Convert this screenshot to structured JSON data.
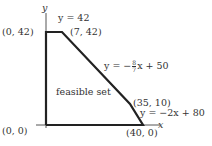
{
  "diagram": {
    "axes": {
      "x_label": "x",
      "y_label": "y"
    },
    "vertices": [
      {
        "label": "(0, 0)",
        "x": 0,
        "y": 0
      },
      {
        "label": "(0, 42)",
        "x": 0,
        "y": 42
      },
      {
        "label": "(7, 42)",
        "x": 7,
        "y": 42
      },
      {
        "label": "(35, 10)",
        "x": 35,
        "y": 10
      },
      {
        "label": "(40, 0)",
        "x": 40,
        "y": 0
      }
    ],
    "lines": [
      {
        "label": "y = 42"
      },
      {
        "label": "y = −",
        "frac_num": "8",
        "frac_den": "7",
        "tail": "x + 50"
      },
      {
        "label": "y = −2x + 80"
      }
    ],
    "region_label": "feasible set",
    "colors": {
      "boundary": "#222222",
      "text": "#333333"
    }
  }
}
